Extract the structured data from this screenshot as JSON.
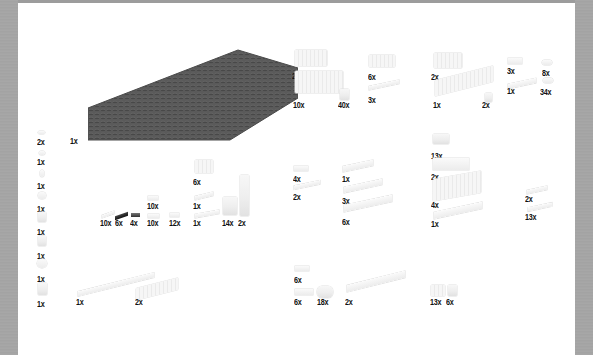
{
  "inventory": {
    "baseplate": {
      "count": "1x",
      "color": "#555555"
    },
    "left_column": [
      {
        "count": "2x",
        "icon": "small-clip-icon"
      },
      {
        "count": "1x",
        "icon": "small-hinge-icon"
      },
      {
        "count": "1x",
        "icon": "hook-icon"
      },
      {
        "count": "1x",
        "icon": "round-plate-icon"
      },
      {
        "count": "1x",
        "icon": "brick-with-clip-icon"
      },
      {
        "count": "1x",
        "icon": "bracket-icon"
      },
      {
        "count": "1x",
        "icon": "flower-icon"
      },
      {
        "count": "1x",
        "icon": "minifig-accessory-icon"
      }
    ],
    "group_top_center": [
      {
        "count": "2x",
        "part": "brick-2x4"
      },
      {
        "count": "10x",
        "part": "brick-2x6"
      },
      {
        "count": "40x",
        "part": "brick-1x1"
      },
      {
        "count": "6x",
        "part": "brick-1x4"
      },
      {
        "count": "3x",
        "part": "tile-1x6"
      }
    ],
    "group_top_right": [
      {
        "count": "2x",
        "part": "brick-2x3"
      },
      {
        "count": "1x",
        "part": "brick-1x10"
      },
      {
        "count": "2x",
        "part": "brick-1x1-round"
      },
      {
        "count": "3x",
        "part": "plate-2x2"
      },
      {
        "count": "1x",
        "part": "plate-2x6"
      },
      {
        "count": "8x",
        "part": "plate-round-small"
      },
      {
        "count": "34x",
        "part": "plate-1x1-round"
      }
    ],
    "group_middle_left": [
      {
        "count": "10x",
        "part": "bar-with-clip",
        "color": "#ffffff"
      },
      {
        "count": "6x",
        "part": "technic-pin",
        "color": "#111111"
      },
      {
        "count": "4x",
        "part": "axle-pin",
        "color": "#555555"
      },
      {
        "count": "10x",
        "part": "plate-1x2-top"
      },
      {
        "count": "10x",
        "part": "plate-1x2-bottom"
      },
      {
        "count": "12x",
        "part": "plate-1x2-jumper"
      },
      {
        "count": "6x",
        "part": "brick-2x2"
      },
      {
        "count": "1x",
        "part": "plate-1x4-top"
      },
      {
        "count": "1x",
        "part": "plate-1x6-bottom"
      },
      {
        "count": "14x",
        "part": "slope-brick"
      },
      {
        "count": "2x",
        "part": "brick-1x1x6-column"
      }
    ],
    "group_middle_center": [
      {
        "count": "4x",
        "part": "plate-2x2"
      },
      {
        "count": "2x",
        "part": "tile-1x4"
      },
      {
        "count": "1x",
        "part": "plate-2x4"
      },
      {
        "count": "3x",
        "part": "plate-2x6"
      },
      {
        "count": "6x",
        "part": "plate-2x8"
      }
    ],
    "group_middle_right": [
      {
        "count": "13x",
        "part": "brick-1x2"
      },
      {
        "count": "2x",
        "part": "plate-4x4"
      },
      {
        "count": "4x",
        "part": "brick-2x8"
      },
      {
        "count": "1x",
        "part": "plate-2x10"
      },
      {
        "count": "2x",
        "part": "plate-1x4"
      },
      {
        "count": "13x",
        "part": "plate-1x6"
      }
    ],
    "group_bottom_left": [
      {
        "count": "1x",
        "part": "plate-1x12"
      },
      {
        "count": "2x",
        "part": "brick-1x8"
      }
    ],
    "group_bottom_center": [
      {
        "count": "6x",
        "part": "plate-1x3-top"
      },
      {
        "count": "6x",
        "part": "plate-2x2-bottom"
      },
      {
        "count": "18x",
        "part": "round-brick-2x2"
      },
      {
        "count": "2x",
        "part": "plate-2x12"
      }
    ],
    "group_bottom_right": [
      {
        "count": "13x",
        "part": "brick-2x2-a"
      },
      {
        "count": "6x",
        "part": "brick-1x2-b"
      }
    ]
  }
}
